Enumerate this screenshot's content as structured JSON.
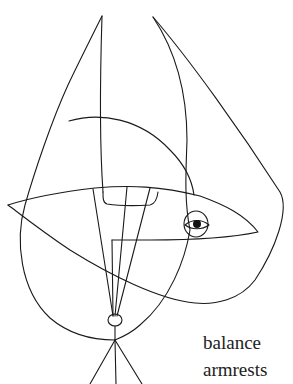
{
  "illustration": {
    "description": "Continuous-line abstract drawing of a figure with an eye, on a tripod base",
    "stroke_color": "#1a1a1a",
    "background": "#ffffff"
  },
  "caption": {
    "line1": "balance",
    "line2": "armrests"
  }
}
